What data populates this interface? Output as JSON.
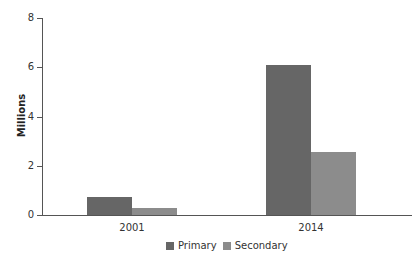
{
  "chart_data": {
    "type": "bar",
    "title": "",
    "xlabel": "",
    "ylabel": "Millions",
    "ylim": [
      0,
      8
    ],
    "yticks": [
      0,
      2,
      4,
      6,
      8
    ],
    "grid": false,
    "legend_position": "bottom",
    "categories": [
      "2001",
      "2014"
    ],
    "series": [
      {
        "name": "Primary",
        "color": "#666666",
        "values": [
          0.73,
          6.1
        ]
      },
      {
        "name": "Secondary",
        "color": "#8c8c8c",
        "values": [
          0.28,
          2.55
        ]
      }
    ]
  },
  "axis": {
    "y_title": "Millions",
    "y_ticks": [
      "0",
      "2",
      "4",
      "6",
      "8"
    ]
  },
  "legend": {
    "items": [
      {
        "label": "Primary",
        "color": "#666666"
      },
      {
        "label": "Secondary",
        "color": "#8c8c8c"
      }
    ]
  }
}
